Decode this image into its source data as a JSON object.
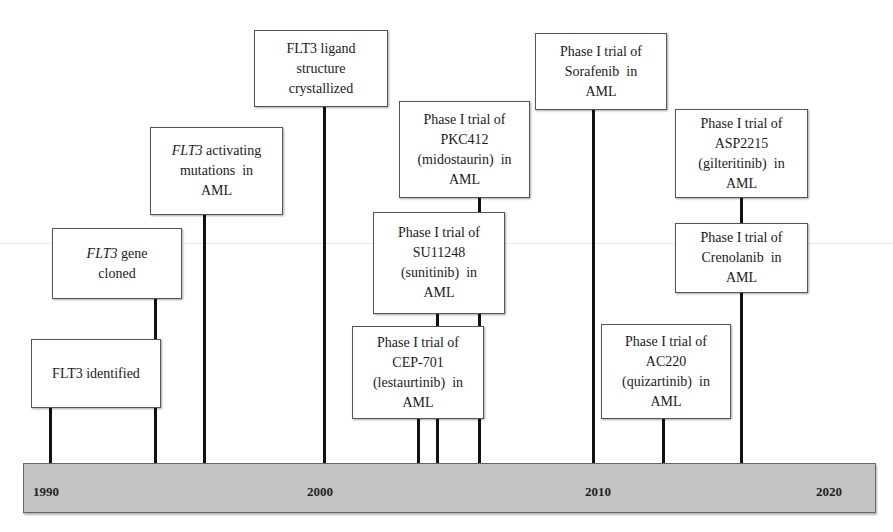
{
  "timeline": {
    "axis_labels": [
      "1990",
      "2000",
      "2010",
      "2020"
    ],
    "bar_color": "#c4c4c4",
    "events": [
      {
        "id": "flt3-identified",
        "lines": [
          "FLT3 identified"
        ],
        "italic_prefix": ""
      },
      {
        "id": "flt3-gene-cloned",
        "italic_prefix": "FLT3",
        "lines": [
          " gene",
          "cloned"
        ]
      },
      {
        "id": "flt3-activating-mutations",
        "italic_prefix": "FLT3",
        "lines": [
          " activating",
          "mutations  in",
          "AML"
        ]
      },
      {
        "id": "flt3-ligand",
        "lines": [
          "FLT3 ligand",
          "structure",
          "crystallized"
        ]
      },
      {
        "id": "pkc412",
        "lines": [
          "Phase I trial of",
          "PKC412",
          "(midostaurin)  in",
          "AML"
        ]
      },
      {
        "id": "su11248",
        "lines": [
          "Phase I trial of",
          "SU11248",
          "(sunitinib)  in",
          "AML"
        ]
      },
      {
        "id": "cep701",
        "lines": [
          "Phase I trial of",
          "CEP-701",
          "(lestaurtinib)  in",
          "AML"
        ]
      },
      {
        "id": "sorafenib",
        "lines": [
          "Phase I trial of",
          "Sorafenib  in",
          "AML"
        ]
      },
      {
        "id": "asp2215",
        "lines": [
          "Phase I trial of",
          "ASP2215",
          "(gilteritinib)  in",
          "AML"
        ]
      },
      {
        "id": "crenolanib",
        "lines": [
          "Phase I trial of",
          "Crenolanib  in",
          "AML"
        ]
      },
      {
        "id": "ac220",
        "lines": [
          "Phase I trial of",
          "AC220",
          "(quizartinib)  in",
          "AML"
        ]
      }
    ]
  }
}
